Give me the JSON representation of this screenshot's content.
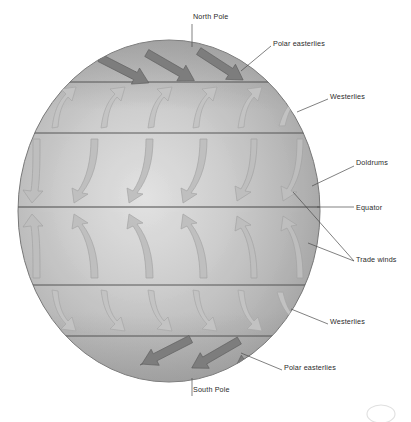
{
  "diagram": {
    "background_color": "#ffffff",
    "globe": {
      "center_x": 169,
      "center_y": 211,
      "radius_x": 151,
      "radius_y": 171,
      "fill_light": "#cfcfcf",
      "fill_mid": "#b4b4b4",
      "fill_dark": "#9d9d9d",
      "outline_color": "#6f6f6f"
    },
    "latitude_lines": {
      "color": "#4a4a4a",
      "y_positions": [
        82,
        133,
        207,
        285,
        336
      ],
      "names": [
        "polar-front-north",
        "horse-latitudes-north",
        "equator",
        "horse-latitudes-south",
        "polar-front-south"
      ]
    },
    "bands": [
      {
        "name": "north-polar-easterlies",
        "wind": "Polar easterlies",
        "direction": "down-left",
        "style": "dark-straight",
        "arrow_count": 3
      },
      {
        "name": "north-westerlies",
        "wind": "Westerlies",
        "direction": "up-right",
        "style": "light-curved",
        "arrow_count": 6
      },
      {
        "name": "northeast-trade-winds",
        "wind": "Trade winds",
        "direction": "down-left",
        "style": "light-curved",
        "arrow_count": 6
      },
      {
        "name": "southeast-trade-winds",
        "wind": "Trade winds",
        "direction": "up-left",
        "style": "light-curved",
        "arrow_count": 6
      },
      {
        "name": "south-westerlies",
        "wind": "Westerlies",
        "direction": "down-right",
        "style": "light-curved",
        "arrow_count": 6
      },
      {
        "name": "south-polar-easterlies",
        "wind": "Polar easterlies",
        "direction": "up-left",
        "style": "dark-straight",
        "arrow_count": 3
      }
    ],
    "labels": [
      {
        "id": "north-pole",
        "text": "North Pole",
        "x": 193,
        "y": 16,
        "align": "left"
      },
      {
        "id": "polar-easterlies-north",
        "text": "Polar easterlies",
        "x": 273,
        "y": 43,
        "align": "left"
      },
      {
        "id": "westerlies-north",
        "text": "Westerlies",
        "x": 330,
        "y": 96,
        "align": "left"
      },
      {
        "id": "doldrums",
        "text": "Doldrums",
        "x": 356,
        "y": 162,
        "align": "left"
      },
      {
        "id": "equator",
        "text": "Equator",
        "x": 356,
        "y": 207,
        "align": "left"
      },
      {
        "id": "trade-winds",
        "text": "Trade winds",
        "x": 356,
        "y": 259,
        "align": "left"
      },
      {
        "id": "westerlies-south",
        "text": "Westerlies",
        "x": 330,
        "y": 321,
        "align": "left"
      },
      {
        "id": "polar-easterlies-south",
        "text": "Polar easterlies",
        "x": 284,
        "y": 367,
        "align": "left"
      },
      {
        "id": "south-pole",
        "text": "South Pole",
        "x": 193,
        "y": 389,
        "align": "left"
      }
    ],
    "label_text_color": "#2a2a2a",
    "leader_line_color": "#4a4a4a"
  }
}
